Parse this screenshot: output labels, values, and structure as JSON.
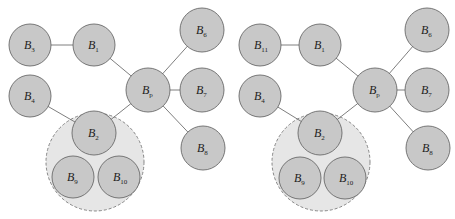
{
  "figure": {
    "panels": [
      {
        "id": "left",
        "group": {
          "cx": 95,
          "cy": 162,
          "r": 49,
          "style": "dashed"
        },
        "nodes": [
          {
            "id": "B3",
            "base": "B",
            "sub": "3",
            "cx": 30,
            "cy": 45,
            "r": 21
          },
          {
            "id": "B1",
            "base": "B",
            "sub": "1",
            "cx": 94,
            "cy": 45,
            "r": 21
          },
          {
            "id": "B4",
            "base": "B",
            "sub": "4",
            "cx": 30,
            "cy": 96,
            "r": 21
          },
          {
            "id": "Bp",
            "base": "B",
            "sub": "p",
            "cx": 148,
            "cy": 90,
            "r": 22
          },
          {
            "id": "B6",
            "base": "B",
            "sub": "6",
            "cx": 202,
            "cy": 30,
            "r": 22
          },
          {
            "id": "B7",
            "base": "B",
            "sub": "7",
            "cx": 202,
            "cy": 90,
            "r": 22
          },
          {
            "id": "B8",
            "base": "B",
            "sub": "8",
            "cx": 203,
            "cy": 148,
            "r": 22
          },
          {
            "id": "B2",
            "base": "B",
            "sub": "2",
            "cx": 94,
            "cy": 133,
            "r": 22
          },
          {
            "id": "B9",
            "base": "B",
            "sub": "9",
            "cx": 73,
            "cy": 177,
            "r": 21
          },
          {
            "id": "B10",
            "base": "B",
            "sub": "10",
            "cx": 119,
            "cy": 177,
            "r": 21
          }
        ],
        "edges": [
          [
            "B3",
            "B1"
          ],
          [
            "B1",
            "Bp"
          ],
          [
            "B4",
            "B2"
          ],
          [
            "B2",
            "Bp"
          ],
          [
            "Bp",
            "B6"
          ],
          [
            "Bp",
            "B7"
          ],
          [
            "Bp",
            "B8"
          ]
        ]
      },
      {
        "id": "right",
        "group": {
          "cx": 321,
          "cy": 162,
          "r": 49,
          "style": "dashed"
        },
        "nodes": [
          {
            "id": "B11",
            "base": "B",
            "sub": "11",
            "cx": 260,
            "cy": 45,
            "r": 21
          },
          {
            "id": "B1",
            "base": "B",
            "sub": "1",
            "cx": 320,
            "cy": 45,
            "r": 21
          },
          {
            "id": "B4",
            "base": "B",
            "sub": "4",
            "cx": 260,
            "cy": 96,
            "r": 21
          },
          {
            "id": "Bp",
            "base": "B",
            "sub": "p",
            "cx": 375,
            "cy": 90,
            "r": 22
          },
          {
            "id": "B6",
            "base": "B",
            "sub": "6",
            "cx": 427,
            "cy": 30,
            "r": 22
          },
          {
            "id": "B7",
            "base": "B",
            "sub": "7",
            "cx": 427,
            "cy": 90,
            "r": 22
          },
          {
            "id": "B8",
            "base": "B",
            "sub": "8",
            "cx": 428,
            "cy": 148,
            "r": 22
          },
          {
            "id": "B2",
            "base": "B",
            "sub": "2",
            "cx": 320,
            "cy": 133,
            "r": 22
          },
          {
            "id": "B9",
            "base": "B",
            "sub": "9",
            "cx": 300,
            "cy": 178,
            "r": 21
          },
          {
            "id": "B10",
            "base": "B",
            "sub": "10",
            "cx": 345,
            "cy": 178,
            "r": 21
          }
        ],
        "edges": [
          [
            "B11",
            "B1"
          ],
          [
            "B1",
            "Bp"
          ],
          [
            "B4",
            "B2"
          ],
          [
            "B2",
            "Bp"
          ],
          [
            "Bp",
            "B6"
          ],
          [
            "Bp",
            "B7"
          ],
          [
            "Bp",
            "B8"
          ]
        ]
      }
    ],
    "colors": {
      "node_fill": "#c8c8c8",
      "node_stroke": "#6a6a6a",
      "group_fill": "#e6e6e6",
      "edge": "#6f6f6f"
    }
  }
}
